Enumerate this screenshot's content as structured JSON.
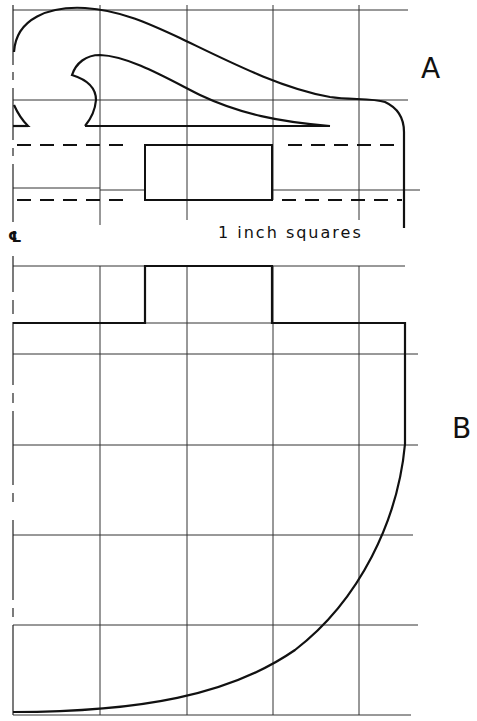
{
  "labels": {
    "part_a": "A",
    "part_b": "B",
    "scale_note": "1 inch squares",
    "centerline": "℄"
  },
  "colors": {
    "ink": "#111111",
    "grid": "#333333",
    "background": "#ffffff"
  },
  "grid": {
    "unit": "1 inch",
    "vertical_lines_x": [
      13,
      100,
      187,
      273,
      359
    ],
    "part_a_horizontal_y": [
      10,
      100,
      188
    ],
    "part_b_horizontal_y": [
      266,
      323,
      354,
      444,
      536,
      627,
      715
    ]
  }
}
